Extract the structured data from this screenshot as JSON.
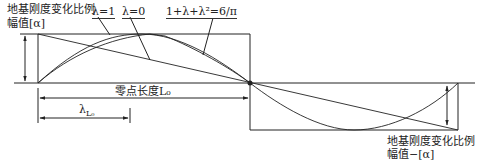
{
  "labels": {
    "top_left_line1": "地基刚度变化比例",
    "top_left_line2": "幅值[α]",
    "lambda_1": "λ=1",
    "lambda_0": "λ=0",
    "formula": "1+λ+λ²=6/π",
    "zero_length": "零点长度L₀",
    "lambda_l0": "λ",
    "lambda_l0_sub": "L₀",
    "bottom_right_line1": "地基刚度变化比例",
    "bottom_right_line2": "幅值−[α]"
  },
  "colors": {
    "line": "#222222",
    "background": "#ffffff"
  },
  "curves": [
    {
      "name": "λ=1",
      "shape": "straight diagonal line from top-left to bottom-right"
    },
    {
      "name": "λ=0",
      "shape": "sinusoidal curve (half-wave positive then negative)"
    },
    {
      "name": "1+λ+λ²=6/π",
      "shape": "intermediate curve"
    }
  ]
}
